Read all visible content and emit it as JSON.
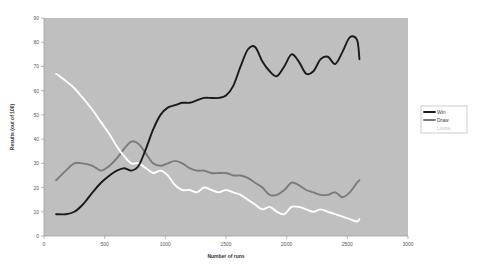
{
  "chart_data": {
    "type": "line",
    "title": "",
    "xlabel": "Number of runs",
    "ylabel": "Results (out of 100)",
    "xlim": [
      0,
      3000
    ],
    "ylim": [
      0,
      90
    ],
    "xticks": [
      0,
      500,
      1000,
      1500,
      2000,
      2500,
      3000
    ],
    "yticks": [
      0,
      10,
      20,
      30,
      40,
      50,
      60,
      70,
      80,
      90
    ],
    "grid": false,
    "legend_position": "right",
    "plot_background": "#bfbfbf",
    "series": [
      {
        "name": "Win",
        "color": "#1a1a1a",
        "x": [
          100,
          180,
          250,
          320,
          400,
          470,
          540,
          600,
          660,
          720,
          780,
          840,
          900,
          960,
          1020,
          1080,
          1140,
          1200,
          1260,
          1320,
          1380,
          1440,
          1500,
          1560,
          1620,
          1680,
          1740,
          1800,
          1860,
          1920,
          1980,
          2040,
          2100,
          2160,
          2220,
          2280,
          2340,
          2400,
          2460,
          2520,
          2580,
          2600
        ],
        "values": [
          9,
          9,
          10,
          13,
          18,
          22,
          25,
          27,
          28,
          27,
          29,
          36,
          44,
          50,
          53,
          54,
          55,
          55,
          56,
          57,
          57,
          57,
          58,
          62,
          70,
          77,
          78,
          72,
          68,
          66,
          70,
          75,
          72,
          67,
          68,
          73,
          74,
          71,
          76,
          82,
          81,
          73
        ]
      },
      {
        "name": "Draw",
        "color": "#7a7a7a",
        "x": [
          100,
          180,
          250,
          320,
          400,
          470,
          540,
          600,
          660,
          720,
          780,
          840,
          900,
          960,
          1020,
          1080,
          1140,
          1200,
          1260,
          1320,
          1380,
          1440,
          1500,
          1560,
          1620,
          1680,
          1740,
          1800,
          1860,
          1920,
          1980,
          2040,
          2100,
          2160,
          2220,
          2280,
          2340,
          2400,
          2460,
          2520,
          2580,
          2600
        ],
        "values": [
          23,
          27,
          30,
          30,
          29,
          27,
          29,
          32,
          36,
          39,
          38,
          34,
          30,
          29,
          30,
          31,
          30,
          28,
          27,
          27,
          26,
          26,
          26,
          25,
          25,
          24,
          22,
          20,
          17,
          17,
          19,
          22,
          21,
          19,
          18,
          17,
          17,
          18,
          16,
          18,
          22,
          23
        ]
      },
      {
        "name": "Loose",
        "color": "#ffffff",
        "x": [
          100,
          180,
          250,
          320,
          400,
          470,
          540,
          600,
          660,
          720,
          780,
          840,
          900,
          960,
          1020,
          1080,
          1140,
          1200,
          1260,
          1320,
          1380,
          1440,
          1500,
          1560,
          1620,
          1680,
          1740,
          1800,
          1860,
          1920,
          1980,
          2040,
          2100,
          2160,
          2220,
          2280,
          2340,
          2400,
          2460,
          2520,
          2580,
          2600
        ],
        "values": [
          67,
          64,
          61,
          57,
          52,
          47,
          42,
          37,
          33,
          30,
          30,
          28,
          26,
          27,
          25,
          21,
          19,
          19,
          18,
          20,
          19,
          18,
          19,
          18,
          17,
          15,
          13,
          11,
          12,
          10,
          9,
          12,
          12,
          11,
          10,
          11,
          10,
          9,
          8,
          7,
          6,
          7
        ]
      }
    ]
  },
  "legend": {
    "items": [
      {
        "label": "Win",
        "color": "#1a1a1a"
      },
      {
        "label": "Draw",
        "color": "#7a7a7a"
      },
      {
        "label": "Loose",
        "color": "#ffffff"
      }
    ]
  },
  "axes": {
    "x_title": "Number of runs",
    "y_title": "Results (out of 100)"
  }
}
